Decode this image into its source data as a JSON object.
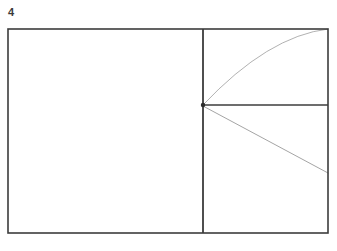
{
  "figure": {
    "label": "4",
    "caption_number": "4",
    "type": "geometric-line-diagram",
    "background_color": "#ffffff",
    "canvas": {
      "width": 337,
      "height": 251
    }
  },
  "colors": {
    "frame_stroke": "#3c3c3c",
    "divider_stroke": "#3c3c3c",
    "horizontal_stroke": "#3c3c3c",
    "curve_stroke": "#a8a8a8",
    "diagonal_stroke": "#9a9a9a",
    "node_fill": "#2b2b2b",
    "label_color": "#3a3a3a"
  },
  "geometry": {
    "outer_rectangle": {
      "name": "outer-frame",
      "x": 8,
      "y": 29,
      "width": 320,
      "height": 204,
      "stroke_width": 1.6
    },
    "vertical_divider": {
      "name": "vertical-divider",
      "x": 203,
      "y1": 29,
      "y2": 233,
      "stroke_width": 1.8
    },
    "junction_node": {
      "name": "junction-node",
      "x": 203,
      "y": 105,
      "radius": 2.2
    },
    "horizontal_line": {
      "name": "horizontal-line",
      "x1": 203,
      "y1": 105,
      "x2": 328,
      "y2": 105,
      "stroke_width": 1.6
    },
    "arc_curve": {
      "name": "arc-curve",
      "start": [
        203,
        105
      ],
      "end": [
        328,
        29
      ],
      "control": [
        268,
        36
      ],
      "stroke_width": 0.9,
      "concavity": "down"
    },
    "diagonal_line": {
      "name": "diagonal-line",
      "x1": 203,
      "y1": 106,
      "x2": 328,
      "y2": 173,
      "stroke_width": 0.9
    }
  },
  "chart_data": {
    "type": "line",
    "title": "4",
    "xlabel": "",
    "ylabel": "",
    "grid": false,
    "legend": null,
    "annotations": [
      "4"
    ],
    "series": [
      {
        "name": "arc-curve",
        "points": [
          [
            203,
            105
          ],
          [
            268,
            36
          ],
          [
            328,
            29
          ]
        ]
      },
      {
        "name": "horizontal-line",
        "points": [
          [
            203,
            105
          ],
          [
            328,
            105
          ]
        ]
      },
      {
        "name": "diagonal-line",
        "points": [
          [
            203,
            106
          ],
          [
            328,
            173
          ]
        ]
      },
      {
        "name": "vertical-divider",
        "points": [
          [
            203,
            29
          ],
          [
            203,
            233
          ]
        ]
      }
    ]
  }
}
